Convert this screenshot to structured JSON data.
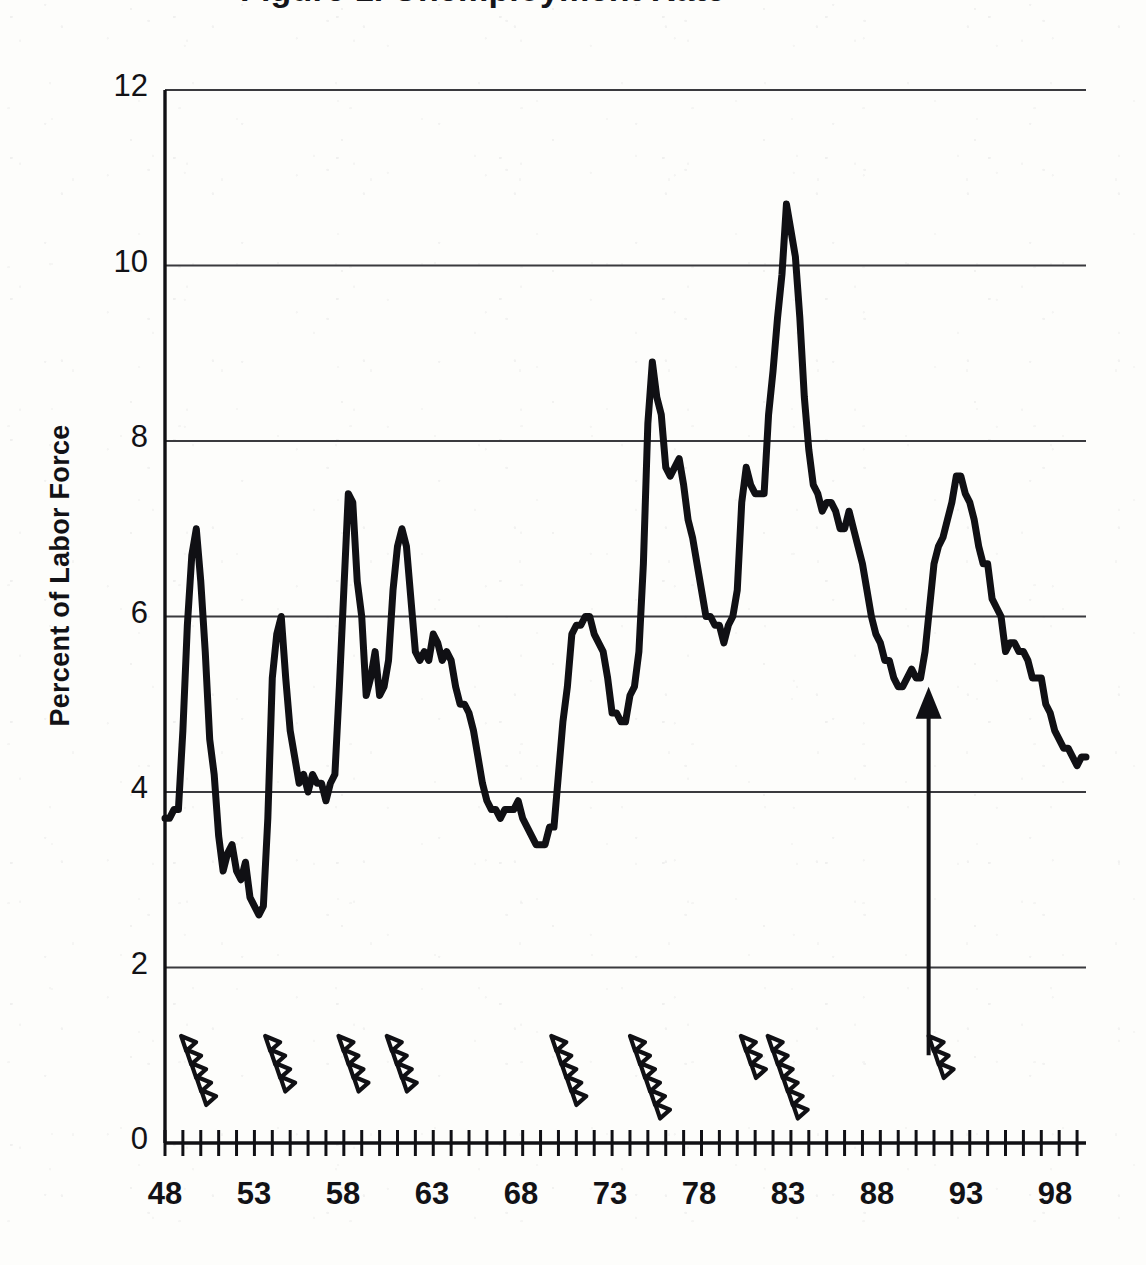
{
  "figure": {
    "title_clipped": "Figure 1. Unemployment Rate",
    "note": "scanned figure, title cropped at top edge"
  },
  "chart_data": {
    "type": "line",
    "title": "Figure 1. Unemployment Rate",
    "xlabel": "",
    "ylabel": "Percent of Labor Force",
    "xlim": [
      48,
      99.5
    ],
    "ylim": [
      0,
      12
    ],
    "yticks": [
      0,
      2,
      4,
      6,
      8,
      10,
      12
    ],
    "ytick_labels": [
      "0",
      "2",
      "4",
      "6",
      "8",
      "10",
      "12"
    ],
    "xticks": [
      48,
      53,
      58,
      63,
      68,
      73,
      78,
      83,
      88,
      93,
      98
    ],
    "xtick_labels": [
      "48",
      "53",
      "58",
      "63",
      "68",
      "73",
      "78",
      "83",
      "88",
      "93",
      "98"
    ],
    "x_minor_tick_step": 1,
    "grid": "horizontal",
    "legend": "none",
    "series": [
      {
        "name": "Unemployment Rate",
        "color": "#101014",
        "x": [
          48.0,
          48.25,
          48.5,
          48.75,
          49.0,
          49.25,
          49.5,
          49.75,
          50.0,
          50.25,
          50.5,
          50.75,
          51.0,
          51.25,
          51.5,
          51.75,
          52.0,
          52.25,
          52.5,
          52.75,
          53.0,
          53.25,
          53.5,
          53.75,
          54.0,
          54.25,
          54.5,
          54.75,
          55.0,
          55.25,
          55.5,
          55.75,
          56.0,
          56.25,
          56.5,
          56.75,
          57.0,
          57.25,
          57.5,
          57.75,
          58.0,
          58.25,
          58.5,
          58.75,
          59.0,
          59.25,
          59.5,
          59.75,
          60.0,
          60.25,
          60.5,
          60.75,
          61.0,
          61.25,
          61.5,
          61.75,
          62.0,
          62.25,
          62.5,
          62.75,
          63.0,
          63.25,
          63.5,
          63.75,
          64.0,
          64.25,
          64.5,
          64.75,
          65.0,
          65.25,
          65.5,
          65.75,
          66.0,
          66.25,
          66.5,
          66.75,
          67.0,
          67.25,
          67.5,
          67.75,
          68.0,
          68.25,
          68.5,
          68.75,
          69.0,
          69.25,
          69.5,
          69.75,
          70.0,
          70.25,
          70.5,
          70.75,
          71.0,
          71.25,
          71.5,
          71.75,
          72.0,
          72.25,
          72.5,
          72.75,
          73.0,
          73.25,
          73.5,
          73.75,
          74.0,
          74.25,
          74.5,
          74.75,
          75.0,
          75.25,
          75.5,
          75.75,
          76.0,
          76.25,
          76.5,
          76.75,
          77.0,
          77.25,
          77.5,
          77.75,
          78.0,
          78.25,
          78.5,
          78.75,
          79.0,
          79.25,
          79.5,
          79.75,
          80.0,
          80.25,
          80.5,
          80.75,
          81.0,
          81.25,
          81.5,
          81.75,
          82.0,
          82.25,
          82.5,
          82.75,
          83.0,
          83.25,
          83.5,
          83.75,
          84.0,
          84.25,
          84.5,
          84.75,
          85.0,
          85.25,
          85.5,
          85.75,
          86.0,
          86.25,
          86.5,
          86.75,
          87.0,
          87.25,
          87.5,
          87.75,
          88.0,
          88.25,
          88.5,
          88.75,
          89.0,
          89.25,
          89.5,
          89.75,
          90.0,
          90.25,
          90.5,
          90.75,
          91.0,
          91.25,
          91.5,
          91.75,
          92.0,
          92.25,
          92.5,
          92.75,
          93.0,
          93.25,
          93.5,
          93.75,
          94.0,
          94.25,
          94.5,
          94.75,
          95.0,
          95.25,
          95.5,
          95.75,
          96.0,
          96.25,
          96.5,
          96.75,
          97.0,
          97.25,
          97.5,
          97.75,
          98.0,
          98.25,
          98.5,
          98.75,
          99.0,
          99.25,
          99.5
        ],
        "y": [
          3.7,
          3.7,
          3.8,
          3.8,
          4.7,
          5.9,
          6.7,
          7.0,
          6.4,
          5.6,
          4.6,
          4.2,
          3.5,
          3.1,
          3.3,
          3.4,
          3.1,
          3.0,
          3.2,
          2.8,
          2.7,
          2.6,
          2.7,
          3.7,
          5.3,
          5.8,
          6.0,
          5.3,
          4.7,
          4.4,
          4.1,
          4.2,
          4.0,
          4.2,
          4.1,
          4.1,
          3.9,
          4.1,
          4.2,
          5.2,
          6.3,
          7.4,
          7.3,
          6.4,
          6.0,
          5.1,
          5.3,
          5.6,
          5.1,
          5.2,
          5.5,
          6.3,
          6.8,
          7.0,
          6.8,
          6.2,
          5.6,
          5.5,
          5.6,
          5.5,
          5.8,
          5.7,
          5.5,
          5.6,
          5.5,
          5.2,
          5.0,
          5.0,
          4.9,
          4.7,
          4.4,
          4.1,
          3.9,
          3.8,
          3.8,
          3.7,
          3.8,
          3.8,
          3.8,
          3.9,
          3.7,
          3.6,
          3.5,
          3.4,
          3.4,
          3.4,
          3.6,
          3.6,
          4.2,
          4.8,
          5.2,
          5.8,
          5.9,
          5.9,
          6.0,
          6.0,
          5.8,
          5.7,
          5.6,
          5.3,
          4.9,
          4.9,
          4.8,
          4.8,
          5.1,
          5.2,
          5.6,
          6.6,
          8.2,
          8.9,
          8.5,
          8.3,
          7.7,
          7.6,
          7.7,
          7.8,
          7.5,
          7.1,
          6.9,
          6.6,
          6.3,
          6.0,
          6.0,
          5.9,
          5.9,
          5.7,
          5.9,
          6.0,
          6.3,
          7.3,
          7.7,
          7.5,
          7.4,
          7.4,
          7.4,
          8.3,
          8.8,
          9.4,
          9.9,
          10.7,
          10.4,
          10.1,
          9.4,
          8.5,
          7.9,
          7.5,
          7.4,
          7.2,
          7.3,
          7.3,
          7.2,
          7.0,
          7.0,
          7.2,
          7.0,
          6.8,
          6.6,
          6.3,
          6.0,
          5.8,
          5.7,
          5.5,
          5.5,
          5.3,
          5.2,
          5.2,
          5.3,
          5.4,
          5.3,
          5.3,
          5.6,
          6.1,
          6.6,
          6.8,
          6.9,
          7.1,
          7.3,
          7.6,
          7.6,
          7.4,
          7.3,
          7.1,
          6.8,
          6.6,
          6.6,
          6.2,
          6.1,
          6.0,
          5.6,
          5.7,
          5.7,
          5.6,
          5.6,
          5.5,
          5.3,
          5.3,
          5.3,
          5.0,
          4.9,
          4.7,
          4.6,
          4.5,
          4.5,
          4.4,
          4.3,
          4.4,
          4.4
        ]
      }
    ],
    "annotations": [
      {
        "type": "arrow",
        "name": "recession-pointer-arrow",
        "x": 90.7,
        "y_from": 1.0,
        "y_to": 5.2,
        "direction": "up",
        "color": "#101014"
      }
    ],
    "recession_markers": {
      "name": "recession-sawtooth-markers",
      "description": "hatched sawtooth marks below the series indicating NBER recession periods",
      "symbol": "sawtooth-triangles",
      "color": "#101014",
      "periods": [
        {
          "label": "1948-49",
          "x": 48.9,
          "teeth": 5
        },
        {
          "label": "1953-54",
          "x": 53.6,
          "teeth": 4
        },
        {
          "label": "1957-58",
          "x": 57.7,
          "teeth": 4
        },
        {
          "label": "1960-61",
          "x": 60.4,
          "teeth": 4
        },
        {
          "label": "1969-70",
          "x": 69.6,
          "teeth": 5
        },
        {
          "label": "1973-75",
          "x": 74.0,
          "teeth": 6
        },
        {
          "label": "1980",
          "x": 80.2,
          "teeth": 3
        },
        {
          "label": "1981-82",
          "x": 81.7,
          "teeth": 6
        },
        {
          "label": "1990-91",
          "x": 90.7,
          "teeth": 3
        }
      ]
    }
  },
  "axes": {
    "y_label": "Percent of Labor Force",
    "y_ticks": [
      "12",
      "10",
      "8",
      "6",
      "4",
      "2",
      "0"
    ],
    "x_ticks": [
      "48",
      "53",
      "58",
      "63",
      "68",
      "73",
      "78",
      "83",
      "88",
      "93",
      "98"
    ]
  },
  "colors": {
    "ink": "#101014",
    "grid": "#3a3a3e",
    "paper": "#fdfdfb"
  }
}
